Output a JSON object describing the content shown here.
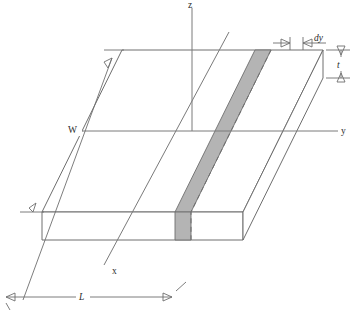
{
  "figure": {
    "type": "3d-slab-diagram",
    "background_color": "#ffffff",
    "line_color": "#6e6e6e",
    "strip_fill_color": "#b4b4b4"
  },
  "axes": [
    {
      "name": "z-axis",
      "label": "z",
      "italic": false,
      "orientation": "vertical-up"
    },
    {
      "name": "y-axis",
      "label": "y",
      "italic": false,
      "orientation": "horizontal-right"
    },
    {
      "name": "x-axis",
      "label": "x",
      "italic": false,
      "orientation": "oblique-down-left"
    }
  ],
  "dimensions": [
    {
      "name": "width",
      "label": "W",
      "italic": false,
      "orientation": "oblique-left-edge"
    },
    {
      "name": "length",
      "label": "L",
      "italic": true,
      "orientation": "horizontal-bottom"
    },
    {
      "name": "thickness",
      "label": "t",
      "italic": true,
      "orientation": "vertical-right"
    },
    {
      "name": "differential-width",
      "label": "dy",
      "italic": true,
      "orientation": "horizontal-top-right"
    }
  ],
  "features": [
    {
      "name": "shaded-strip",
      "label": "",
      "interactable": false
    },
    {
      "name": "hidden-edge-dashed",
      "label": "",
      "interactable": false
    }
  ]
}
